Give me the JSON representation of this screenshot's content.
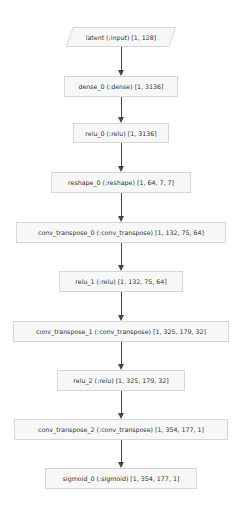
{
  "diagram": {
    "type": "flowchart",
    "direction": "top-to-bottom",
    "nodes": [
      {
        "id": "latent",
        "label": "latent (:input) [1, 128]",
        "shape": "parallelogram"
      },
      {
        "id": "dense_0",
        "label": "dense_0 (:dense) [1, 3136]",
        "shape": "rect"
      },
      {
        "id": "relu_0",
        "label": "relu_0 (:relu) [1, 3136]",
        "shape": "rect"
      },
      {
        "id": "reshape_0",
        "label": "reshape_0 (:reshape) [1, 64, 7, 7]",
        "shape": "rect"
      },
      {
        "id": "conv_transpose_0",
        "label": "conv_transpose_0 (:conv_transpose) [1, 132, 75, 64]",
        "shape": "rect"
      },
      {
        "id": "relu_1",
        "label": "relu_1 (:relu) [1, 132, 75, 64]",
        "shape": "rect"
      },
      {
        "id": "conv_transpose_1",
        "label": "conv_transpose_1 (:conv_transpose) [1, 325, 179, 32]",
        "shape": "rect"
      },
      {
        "id": "relu_2",
        "label": "relu_2 (:relu) [1, 325, 179, 32]",
        "shape": "rect"
      },
      {
        "id": "conv_transpose_2",
        "label": "conv_transpose_2 (:conv_transpose) [1, 354, 177, 1]",
        "shape": "rect"
      },
      {
        "id": "sigmoid_0",
        "label": "sigmoid_0 (:sigmoid) [1, 354, 177, 1]",
        "shape": "rect"
      }
    ],
    "edges": [
      [
        "latent",
        "dense_0"
      ],
      [
        "dense_0",
        "relu_0"
      ],
      [
        "relu_0",
        "reshape_0"
      ],
      [
        "reshape_0",
        "conv_transpose_0"
      ],
      [
        "conv_transpose_0",
        "relu_1"
      ],
      [
        "relu_1",
        "conv_transpose_1"
      ],
      [
        "conv_transpose_1",
        "relu_2"
      ],
      [
        "relu_2",
        "conv_transpose_2"
      ],
      [
        "conv_transpose_2",
        "sigmoid_0"
      ]
    ],
    "colors": {
      "node_fill": "#f7f7f7",
      "node_border": "#d6d6d6",
      "edge": "#444444",
      "text": "#333333"
    }
  }
}
